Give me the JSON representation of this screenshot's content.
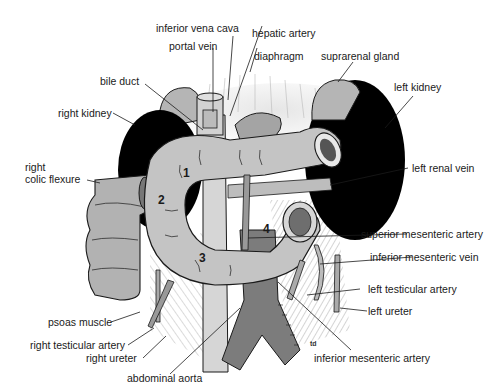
{
  "diagram": {
    "labels": {
      "inferior_vena_cava": "inferior vena cava",
      "portal_vein": "portal vein",
      "hepatic_artery": "hepatic artery",
      "diaphragm": "diaphragm",
      "suprarenal_gland": "suprarenal gland",
      "bile_duct": "bile duct",
      "right_kidney": "right kidney",
      "left_kidney": "left kidney",
      "right_colic_flexure_1": "right",
      "right_colic_flexure_2": "colic flexure",
      "left_renal_vein": "left renal vein",
      "superior_mesenteric_artery": "superior mesenteric artery",
      "inferior_mesenteric_vein": "inferior mesenteric vein",
      "psoas_muscle": "psoas muscle",
      "right_testicular_artery": "right testicular artery",
      "left_testicular_artery": "left testicular artery",
      "right_ureter": "right ureter",
      "left_ureter": "left ureter",
      "abdominal_aorta": "abdominal aorta",
      "inferior_mesenteric_artery": "inferior mesenteric artery"
    },
    "duodenum_parts": [
      "1",
      "2",
      "3",
      "4"
    ],
    "signature": "td",
    "colors": {
      "kidney": "#000000",
      "duodenum": "#c4c4c4",
      "vessel_dark": "#7a7a7a",
      "vessel_light": "#d8d8d8",
      "outline": "#1a1a1a",
      "hatch": "#8a8a8a"
    }
  }
}
